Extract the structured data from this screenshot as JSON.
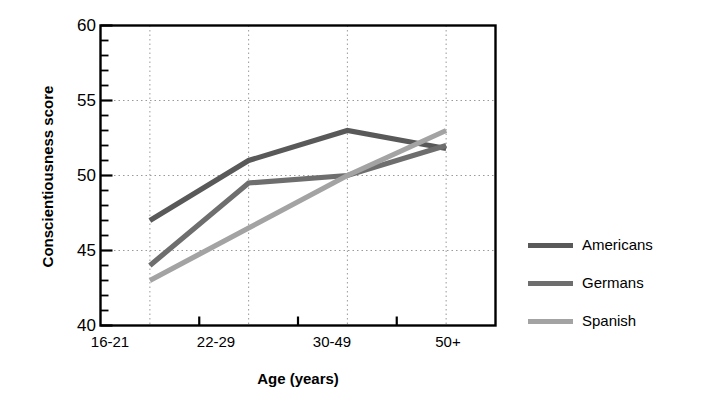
{
  "chart_data": {
    "type": "line",
    "title": "",
    "xlabel": "Age (years)",
    "ylabel": "Conscientiousness score",
    "categories": [
      "16-21",
      "22-29",
      "30-49",
      "50+"
    ],
    "ylim": [
      40,
      60
    ],
    "yticks": [
      40,
      45,
      50,
      55,
      60
    ],
    "ytick_labels": [
      "40",
      "45",
      "50",
      "55",
      "60"
    ],
    "y_minor_tick_step": 1,
    "grid": "dotted",
    "legend_position": "right",
    "series": [
      {
        "name": "Americans",
        "color": "#595959",
        "values": [
          47,
          51,
          53,
          51.8
        ]
      },
      {
        "name": "Germans",
        "color": "#6e6e6e",
        "values": [
          44,
          49.5,
          50,
          52
        ]
      },
      {
        "name": "Spanish",
        "color": "#a3a3a3",
        "values": [
          43,
          46.5,
          50,
          53
        ]
      }
    ]
  },
  "axes": {
    "ytick_0": "60",
    "ytick_1": "55",
    "ytick_2": "50",
    "ytick_3": "45",
    "ytick_4": "40",
    "xtick_0": "16-21",
    "xtick_1": "22-29",
    "xtick_2": "30-49",
    "xtick_3": "50+",
    "xlabel": "Age (years)",
    "ylabel": "Conscientiousness score"
  },
  "legend": {
    "items": [
      {
        "label": "Americans",
        "color": "#595959"
      },
      {
        "label": "Germans",
        "color": "#6e6e6e"
      },
      {
        "label": "Spanish",
        "color": "#a3a3a3"
      }
    ]
  }
}
